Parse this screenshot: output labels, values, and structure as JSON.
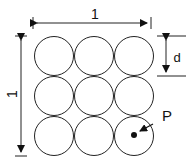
{
  "diagram": {
    "width_label": "1",
    "height_label": "1",
    "diameter_label": "d",
    "point_label": "P",
    "grid": {
      "rows": 3,
      "cols": 3
    },
    "stroke_color": "#222222",
    "background": "#ffffff"
  }
}
